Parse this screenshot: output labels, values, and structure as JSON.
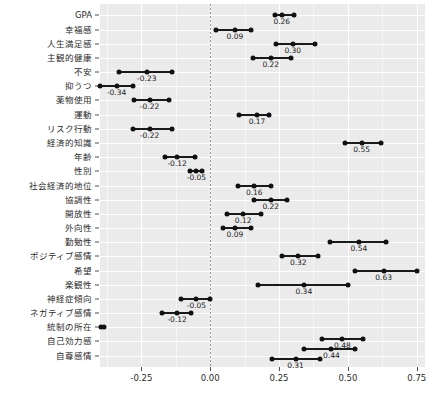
{
  "chart_data": {
    "type": "scatter",
    "title": "",
    "xlabel": "",
    "ylabel": "",
    "xlim": [
      -0.4,
      0.78
    ],
    "xticks": [
      -0.25,
      0.0,
      0.25,
      0.5,
      0.75
    ],
    "xticklabels": [
      "-0.25",
      "0.00",
      "0.25",
      "0.50",
      "0.75"
    ],
    "grid": true,
    "legend": false,
    "zero_reference_line": 0.0,
    "categories": [
      "GPA",
      "幸福感",
      "人生満足感",
      "主観的健康",
      "不安",
      "抑うつ",
      "薬物使用",
      "運動",
      "リスク行動",
      "経済的知識",
      "年齢",
      "性別",
      "社会経済的地位",
      "協調性",
      "開放性",
      "外向性",
      "勤勉性",
      "ポジティブ感情",
      "希望",
      "楽観性",
      "神経症傾向",
      "ネガティブ感情",
      "統制の所在",
      "自己効力感",
      "自尊感情"
    ],
    "points": [
      {
        "label": "GPA",
        "estimate": 0.26,
        "low": 0.235,
        "high": 0.305,
        "value_text": "0.26"
      },
      {
        "label": "幸福感",
        "estimate": 0.09,
        "low": 0.02,
        "high": 0.15,
        "value_text": "0.09"
      },
      {
        "label": "人生満足感",
        "estimate": 0.3,
        "low": 0.24,
        "high": 0.38,
        "value_text": "0.30"
      },
      {
        "label": "主観的健康",
        "estimate": 0.22,
        "low": 0.155,
        "high": 0.295,
        "value_text": "0.22"
      },
      {
        "label": "不安",
        "estimate": -0.23,
        "low": -0.33,
        "high": -0.14,
        "value_text": "-0.23"
      },
      {
        "label": "抑うつ",
        "estimate": -0.34,
        "low": -0.4,
        "high": -0.28,
        "value_text": "-0.34"
      },
      {
        "label": "薬物使用",
        "estimate": -0.22,
        "low": -0.275,
        "high": -0.15,
        "value_text": "-0.22"
      },
      {
        "label": "運動",
        "estimate": 0.17,
        "low": 0.105,
        "high": 0.215,
        "value_text": "0.17"
      },
      {
        "label": "リスク行動",
        "estimate": -0.22,
        "low": -0.28,
        "high": -0.14,
        "value_text": "-0.22"
      },
      {
        "label": "経済的知識",
        "estimate": 0.55,
        "low": 0.49,
        "high": 0.62,
        "value_text": "0.55"
      },
      {
        "label": "年齢",
        "estimate": -0.12,
        "low": -0.165,
        "high": -0.055,
        "value_text": "-0.12"
      },
      {
        "label": "性別",
        "estimate": -0.05,
        "low": -0.075,
        "high": -0.03,
        "value_text": "-0.05"
      },
      {
        "label": "社会経済的地位",
        "estimate": 0.16,
        "low": 0.1,
        "high": 0.22,
        "value_text": "0.16"
      },
      {
        "label": "協調性",
        "estimate": 0.22,
        "low": 0.16,
        "high": 0.28,
        "value_text": "0.22"
      },
      {
        "label": "開放性",
        "estimate": 0.12,
        "low": 0.06,
        "high": 0.185,
        "value_text": "0.12"
      },
      {
        "label": "外向性",
        "estimate": 0.09,
        "low": 0.045,
        "high": 0.15,
        "value_text": "0.09"
      },
      {
        "label": "勤勉性",
        "estimate": 0.54,
        "low": 0.435,
        "high": 0.64,
        "value_text": "0.54"
      },
      {
        "label": "ポジティブ感情",
        "estimate": 0.32,
        "low": 0.26,
        "high": 0.39,
        "value_text": "0.32"
      },
      {
        "label": "希望",
        "estimate": 0.63,
        "low": 0.525,
        "high": 0.75,
        "value_text": "0.63"
      },
      {
        "label": "楽観性",
        "estimate": 0.34,
        "low": 0.175,
        "high": 0.5,
        "value_text": "0.34"
      },
      {
        "label": "神経症傾向",
        "estimate": -0.05,
        "low": -0.105,
        "high": 0.0,
        "value_text": "-0.05"
      },
      {
        "label": "ネガティブ感情",
        "estimate": -0.12,
        "low": -0.175,
        "high": -0.07,
        "value_text": "-0.12"
      },
      {
        "label": "統制の所在",
        "estimate": null,
        "low": -0.395,
        "high": -0.385,
        "value_text": ""
      },
      {
        "label": "自己効力感",
        "estimate": 0.48,
        "low": 0.405,
        "high": 0.555,
        "value_text": "0.48"
      },
      {
        "label": "自尊感情",
        "estimate": 0.44,
        "low": 0.34,
        "high": 0.525,
        "value_text": "0.44"
      },
      {
        "label": "自尊感情2",
        "estimate": 0.31,
        "low": 0.225,
        "high": 0.4,
        "value_text": "0.31"
      }
    ],
    "colors": {
      "panel_background": "#ebebeb",
      "grid_major": "#ffffff",
      "point": "#111111",
      "interval": "#1a1a1a",
      "zero_line": "#9a9a9a",
      "text": "#2b2b2b"
    }
  }
}
